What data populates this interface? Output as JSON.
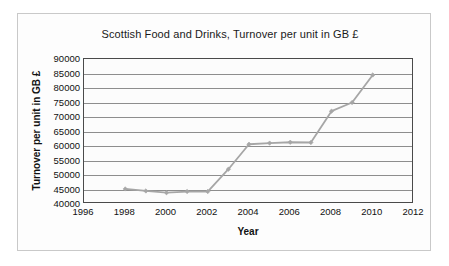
{
  "chart_data": {
    "type": "line",
    "title": "Scottish Food and Drinks, Turnover per unit in GB £",
    "xlabel": "Year",
    "ylabel": "Turnover per unit in GB £",
    "xlim": [
      1996,
      2012
    ],
    "ylim": [
      40000,
      90000
    ],
    "xticks": [
      1996,
      1998,
      2000,
      2002,
      2004,
      2006,
      2008,
      2010,
      2012
    ],
    "yticks": [
      40000,
      45000,
      50000,
      55000,
      60000,
      65000,
      70000,
      75000,
      80000,
      85000,
      90000
    ],
    "xtick_labels": [
      "1996",
      "1998",
      "2000",
      "2002",
      "2004",
      "2006",
      "2008",
      "2010",
      "2012"
    ],
    "ytick_labels": [
      "40000",
      "45000",
      "50000",
      "55000",
      "60000",
      "65000",
      "70000",
      "75000",
      "80000",
      "85000",
      "90000"
    ],
    "grid": true,
    "grid_axis": "y",
    "legend": false,
    "line_color": "#a6a6a6",
    "marker": "diamond",
    "x": [
      1998,
      1999,
      2000,
      2001,
      2002,
      2003,
      2004,
      2005,
      2006,
      2007,
      2008,
      2009,
      2010
    ],
    "values": [
      45200,
      44500,
      43900,
      44300,
      44300,
      52000,
      60600,
      61000,
      61300,
      61200,
      72000,
      75000,
      84500
    ],
    "series": [
      {
        "name": "Turnover per unit",
        "values": [
          45200,
          44500,
          43900,
          44300,
          44300,
          52000,
          60600,
          61000,
          61300,
          61200,
          72000,
          75000,
          84500
        ]
      }
    ]
  }
}
